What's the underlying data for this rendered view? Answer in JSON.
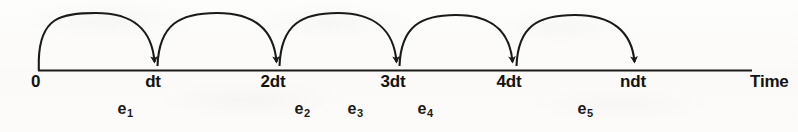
{
  "figure": {
    "kind": "timeline-diagram",
    "axis": {
      "name": "time-axis",
      "end_label": "Time",
      "start_x": 38,
      "end_x": 752,
      "baseline_y": 70,
      "color": "#1a1a1a"
    },
    "ticks": [
      {
        "label": "0",
        "x": 38
      },
      {
        "label": "dt",
        "x": 155
      },
      {
        "label": "2dt",
        "x": 277
      },
      {
        "label": "3dt",
        "x": 397
      },
      {
        "label": "4dt",
        "x": 513
      },
      {
        "label": "ndt",
        "x": 635
      }
    ],
    "transitions": [
      {
        "name": "transition-0-to-dt",
        "from_x": 38,
        "to_x": 155,
        "peak_y": 13
      },
      {
        "name": "transition-dt-to-2dt",
        "from_x": 157,
        "to_x": 277,
        "peak_y": 13
      },
      {
        "name": "transition-2dt-to-3dt",
        "from_x": 279,
        "to_x": 397,
        "peak_y": 13
      },
      {
        "name": "transition-3dt-to-4dt",
        "from_x": 399,
        "to_x": 513,
        "peak_y": 15
      },
      {
        "name": "transition-4dt-to-ndt",
        "from_x": 516,
        "to_x": 635,
        "peak_y": 15
      }
    ],
    "events": [
      {
        "base": "e",
        "sub": "1",
        "x": 125
      },
      {
        "base": "e",
        "sub": "2",
        "x": 302
      },
      {
        "base": "e",
        "sub": "3",
        "x": 355
      },
      {
        "base": "e",
        "sub": "4",
        "x": 425
      },
      {
        "base": "e",
        "sub": "5",
        "x": 585
      }
    ]
  }
}
